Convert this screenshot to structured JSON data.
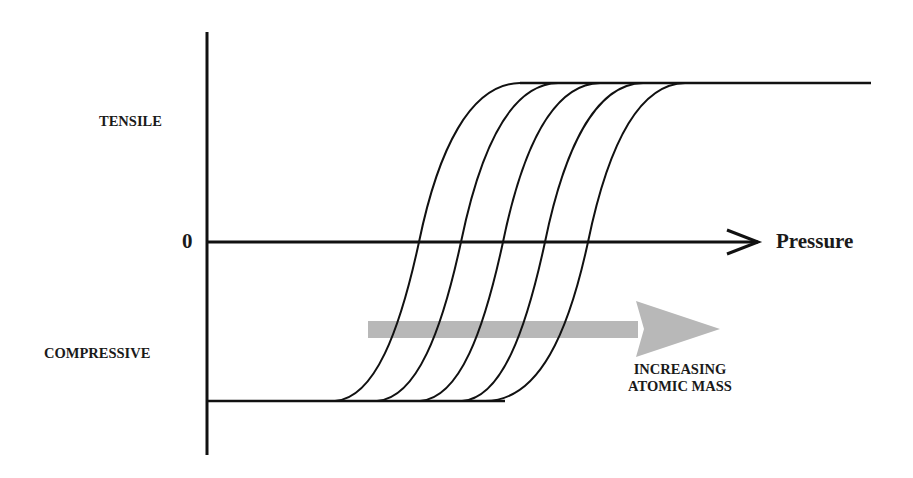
{
  "diagram": {
    "type": "qualitative-line-diagram",
    "y_axis": {
      "top_label": "TENSILE",
      "zero_label": "0",
      "bottom_label": "COMPRESSIVE"
    },
    "x_axis": {
      "label": "Pressure"
    },
    "annotation": {
      "line1": "INCREASING",
      "line2": "ATOMIC MASS",
      "arrow_color": "#b5b5b5"
    },
    "curves": {
      "count": 5,
      "shape": "sigmoid step from compressive plateau to tensile plateau",
      "zero_crossings_px": [
        419,
        461,
        503,
        545,
        588
      ],
      "bottom_start_px": [
        335,
        377,
        420,
        462,
        505
      ],
      "top_end_px": [
        520,
        558,
        600,
        643,
        685
      ]
    },
    "colors": {
      "line": "#111111",
      "background": "#ffffff"
    }
  }
}
